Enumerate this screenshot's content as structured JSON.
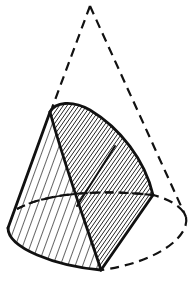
{
  "figure": {
    "colors": {
      "stroke": "#111111",
      "background": "#ffffff",
      "hatch": "#111111"
    },
    "apex": [
      90,
      6
    ],
    "parts": [
      {
        "name": "hidden-cone-outline",
        "style": "dashed"
      },
      {
        "name": "base-ellipse-back",
        "style": "dashed"
      },
      {
        "name": "base-ellipse-front",
        "style": "solid"
      },
      {
        "name": "lateral-surface",
        "style": "sparse-hatch"
      },
      {
        "name": "section-surface",
        "style": "dense-hatch"
      }
    ]
  }
}
